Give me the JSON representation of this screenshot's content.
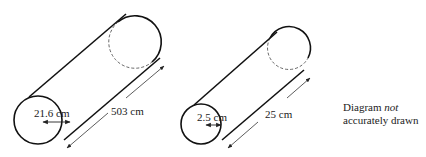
{
  "diagram": {
    "note_line1_prefix": "Diagram ",
    "note_line1_italic": "not",
    "note_line2": "accurately drawn",
    "cylinders": [
      {
        "name": "large-cylinder",
        "diameter_label": "21.6 cm",
        "length_label": "503 cm"
      },
      {
        "name": "small-cylinder",
        "diameter_label": "2.5 cm",
        "length_label": "25 cm"
      }
    ],
    "colors": {
      "stroke": "#111111",
      "dashed": "#555555",
      "arrow": "#333333"
    }
  }
}
